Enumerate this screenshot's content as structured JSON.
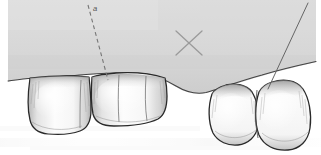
{
  "figure": {
    "kind": "dental-line-illustration",
    "width": 321,
    "height": 155,
    "background_color": "#ffffff"
  },
  "colors": {
    "paper": "#ffffff",
    "tissue_gray": "#d4d4d4",
    "tissue_gray_light": "#dedede",
    "tissue_gray_dark": "#c7c7c7",
    "tooth_fill": "#fbfbfb",
    "tooth_shadow": "#b9b9b9",
    "tooth_shadow_deep": "#8f8f8f",
    "outline": "#2b2b2b",
    "line_gray": "#6f6f6f",
    "label_gray": "#4a4a4a",
    "scan_noise": "#f2f2f2"
  },
  "annotations": {
    "dashed_line": {
      "name": "reference-line-a",
      "label": "a",
      "label_x": 93,
      "label_y": 10,
      "x1": 88,
      "y1": 5,
      "x2": 108,
      "y2": 80,
      "dash_pattern": "4 3",
      "stroke_width": 1.1,
      "color": "#6f6f6f"
    },
    "cross_mark": {
      "name": "cross-mark-x",
      "center_x": 189,
      "center_y": 43,
      "half_size": 13,
      "stroke_width": 1.2,
      "color": "#8a8a8a"
    },
    "pointer_line": {
      "name": "pointer-line-right",
      "x1": 307,
      "y1": 4,
      "x2": 268,
      "y2": 89,
      "stroke_width": 1.0,
      "color": "#5e5e5e"
    }
  },
  "tissue": {
    "name": "alveolar-mucosa-field",
    "left": 8,
    "top": 0,
    "right": 316,
    "description": "Gray soft-tissue / gingiva field occupying upper portion of drawing"
  },
  "teeth": [
    {
      "id": "tooth-1",
      "name": "tooth-first-molar-left",
      "position": "left-distal",
      "x": 28,
      "y": 74,
      "width": 64,
      "height": 60,
      "cusp_grooves": 1
    },
    {
      "id": "tooth-2",
      "name": "tooth-second-premolar",
      "position": "left-mesial",
      "x": 90,
      "y": 76,
      "width": 78,
      "height": 50,
      "cusp_grooves": 2
    },
    {
      "id": "tooth-3",
      "name": "tooth-canine",
      "position": "right-distal",
      "x": 208,
      "y": 85,
      "width": 52,
      "height": 60,
      "cusp_grooves": 0
    },
    {
      "id": "tooth-4",
      "name": "tooth-lateral-incisor",
      "position": "right-mesial",
      "x": 255,
      "y": 84,
      "width": 56,
      "height": 66,
      "cusp_grooves": 0
    }
  ],
  "edentulous_gap": {
    "name": "edentulous-ridge-span",
    "start_x": 166,
    "end_x": 210,
    "description": "Healed ridge between second premolar and canine"
  }
}
